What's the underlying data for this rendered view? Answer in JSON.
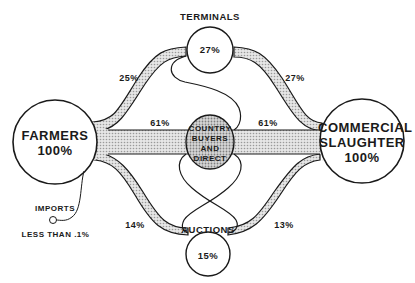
{
  "diagram": {
    "nodes": {
      "farmers": {
        "name": "FARMERS",
        "value": "100%"
      },
      "slaughter": {
        "name_line1": "COMMERCIAL",
        "name_line2": "SLAUGHTER",
        "value": "100%"
      },
      "terminals": {
        "name": "TERMINALS",
        "value": "27%"
      },
      "auctions": {
        "name": "AUCTIONS",
        "value": "15%"
      },
      "country": {
        "line1": "COUNTRY",
        "line2": "BUYERS",
        "line3": "AND",
        "line4": "DIRECT"
      },
      "imports": {
        "name": "IMPORTS",
        "value": "LESS THAN .1%"
      }
    },
    "flows": {
      "farmers_to_terminals": "25%",
      "terminals_to_slaughter": "27%",
      "farmers_to_country": "61%",
      "country_to_slaughter": "61%",
      "farmers_to_auctions": "14%",
      "auctions_to_slaughter": "13%"
    },
    "colors": {
      "line": "#1a1a1a",
      "band_fill": "#d8d8d8",
      "country_fill": "#c4c4c4",
      "background": "#ffffff"
    }
  }
}
